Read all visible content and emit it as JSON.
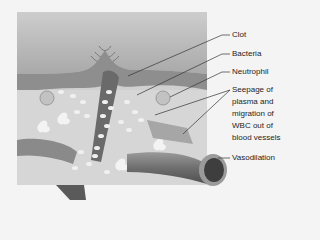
{
  "figure": {
    "type": "anatomical-illustration",
    "colors": {
      "background": "#f4f4f4",
      "panel": "#cfcfcf",
      "skin_top": "#bdbdbd",
      "dermis_band": "#8a8a8a",
      "tissue": "#d9d9d9",
      "cells": "#f2f2f2",
      "vessel": "#7a7a7a",
      "leader_line": "#333333",
      "label_text": "#1e1e1e"
    }
  },
  "labels": [
    {
      "id": "clot",
      "text": "Clot"
    },
    {
      "id": "bacteria",
      "text": "Bacteria"
    },
    {
      "id": "neutrophil",
      "text": "Neutrophil"
    },
    {
      "id": "seepage_line1",
      "text": "Seepage of"
    },
    {
      "id": "seepage_line2",
      "text": "plasma and"
    },
    {
      "id": "seepage_line3",
      "text": "migration of"
    },
    {
      "id": "seepage_line4",
      "text": "WBC out of"
    },
    {
      "id": "seepage_line5",
      "text": "blood vessels"
    },
    {
      "id": "vasodilation",
      "text": "Vasodilation"
    }
  ]
}
